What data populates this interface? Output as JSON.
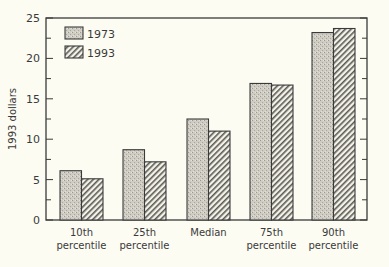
{
  "chart_data": {
    "type": "bar",
    "title": "",
    "xlabel": "",
    "ylabel": "1993 dollars",
    "ylim": [
      0,
      25
    ],
    "yticks": [
      0,
      5,
      10,
      15,
      20,
      25
    ],
    "grid": false,
    "legend_position": "upper left",
    "categories": [
      [
        "10th",
        "percentile"
      ],
      [
        "25th",
        "percentile"
      ],
      [
        "Median"
      ],
      [
        "75th",
        "percentile"
      ],
      [
        "90th",
        "percentile"
      ]
    ],
    "series": [
      {
        "name": "1973",
        "pattern": "stipple",
        "values": [
          6.1,
          8.7,
          12.5,
          16.9,
          23.2
        ]
      },
      {
        "name": "1993",
        "pattern": "hatch",
        "values": [
          5.1,
          7.2,
          11.0,
          16.7,
          23.7
        ]
      }
    ]
  },
  "colors": {
    "background": "#fdfcf3",
    "ink": "#3a3a3a",
    "stipple": "#c8c6bc",
    "hatch_bg": "#f2f0e6"
  }
}
